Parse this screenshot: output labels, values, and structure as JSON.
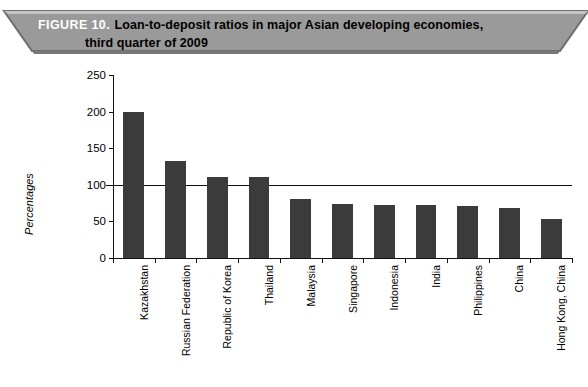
{
  "banner": {
    "figure_number": "FIGURE 10.",
    "title_line1": "Loan-to-deposit ratios in major Asian developing economies,",
    "title_line2": "third quarter of 2009",
    "background_color": "#9a9a9a",
    "figure_number_color": "#ffffff",
    "title_color": "#000000"
  },
  "chart_data": {
    "type": "bar",
    "title": "Loan-to-deposit ratios in major Asian developing economies, third quarter of 2009",
    "xlabel": "",
    "ylabel": "Percentages",
    "ylim": [
      0,
      250
    ],
    "yticks": [
      0,
      50,
      100,
      150,
      200,
      250
    ],
    "ytick_labels": [
      "0",
      "50",
      "100",
      "150",
      "200",
      "250"
    ],
    "grid": false,
    "legend": null,
    "bar_color": "#3b3b3b",
    "reference_line": {
      "value": 100,
      "color": "#111111",
      "label": ""
    },
    "categories": [
      "Kazakhstan",
      "Russian Federation",
      "Republic of Korea",
      "Thailand",
      "Malaysia",
      "Singapore",
      "Indonesia",
      "India",
      "Philippines",
      "China",
      "Hong Kong, China"
    ],
    "values": [
      200,
      132,
      110,
      110,
      80,
      74,
      73,
      72,
      71,
      68,
      53
    ]
  }
}
